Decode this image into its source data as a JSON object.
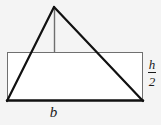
{
  "figure": {
    "background_color": "#f4f4f4",
    "fill_color": "#ffffff",
    "stroke_color_heavy": "#111111",
    "stroke_color_light": "#777777",
    "labels": {
      "base": "b",
      "half_height_numerator": "h",
      "half_height_denominator": "2"
    },
    "shapes": {
      "rectangle": {
        "name": "rectangle",
        "left": 7,
        "top": 52,
        "right": 143,
        "bottom": 101
      },
      "triangle": {
        "name": "triangle",
        "apex_x": 54,
        "apex_y": 7,
        "base_left_x": 7,
        "base_right_x": 143,
        "base_y": 101
      },
      "height_line": {
        "name": "height-line",
        "x": 54,
        "top": 7,
        "bottom": 52
      }
    }
  }
}
